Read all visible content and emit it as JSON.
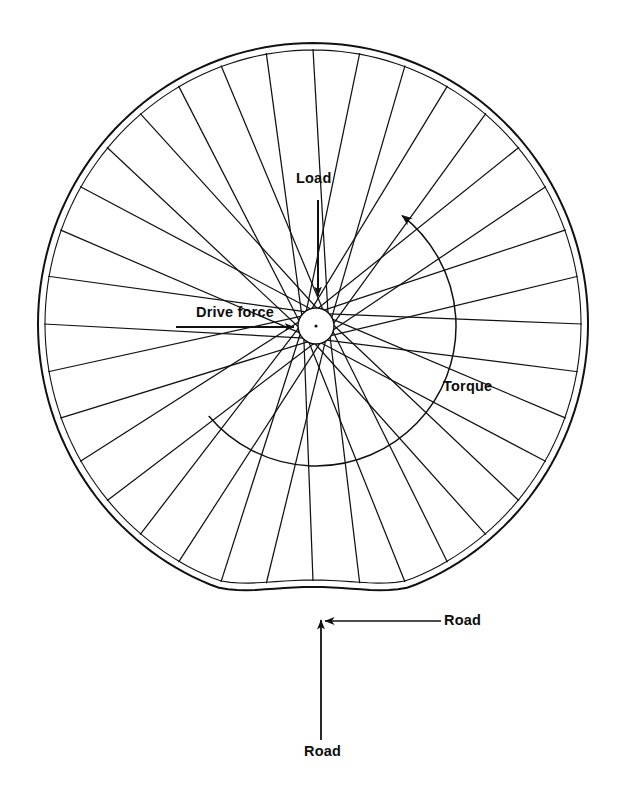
{
  "figure": {
    "background_color": "#ffffff",
    "ink_color": "#111111",
    "labels": {
      "load": "Load",
      "drive_force": "Drive force",
      "torque": "Torque",
      "road_side": "Road",
      "road_bottom": "Road"
    }
  },
  "chart_data": {
    "type": "diagram",
    "xlabel": "",
    "ylabel": "",
    "annotations": [
      {
        "name": "load",
        "text": "Load",
        "arrow": "vertical-down",
        "from": [
          318,
          200
        ],
        "to": [
          318,
          294
        ],
        "label_at": [
          296,
          171
        ]
      },
      {
        "name": "drive-force",
        "text": "Drive force",
        "arrow": "horizontal-right",
        "from": [
          176,
          327
        ],
        "to": [
          292,
          327
        ],
        "label_at": [
          196,
          305
        ]
      },
      {
        "name": "torque",
        "text": "Torque",
        "arrow": "arc-counterclockwise",
        "arrowhead_at": [
          409,
          231
        ],
        "label_at": [
          443,
          379
        ]
      },
      {
        "name": "road-side",
        "text": "Road",
        "arrow": "horizontal-left",
        "from": [
          440,
          621
        ],
        "to": [
          322,
          621
        ],
        "label_at": [
          444,
          613
        ]
      },
      {
        "name": "road-bottom",
        "text": "Road",
        "arrow": "vertical-up",
        "from": [
          321,
          740
        ],
        "to": [
          321,
          618
        ],
        "label_at": [
          304,
          744
        ]
      }
    ],
    "geometry": {
      "rim": {
        "center": [
          313,
          324
        ],
        "radius_x": 275,
        "radius_y": 281,
        "flat_contact_bottom": true,
        "double_line_rim": true
      },
      "hub": {
        "center": [
          316,
          326
        ],
        "radius": 18,
        "fill": "#ffffff"
      },
      "spokes": {
        "count": 36,
        "pattern": "tangential-crossed",
        "hub_tangent_radius": 14
      },
      "torque_arc": {
        "center": [
          316,
          326
        ],
        "radius": 140,
        "start_angle_deg": 140,
        "end_angle_deg": -52
      }
    }
  }
}
